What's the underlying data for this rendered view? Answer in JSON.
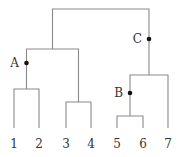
{
  "diagram": {
    "type": "dendrogram",
    "leaves": [
      {
        "id": "1",
        "label": "1",
        "x": 14
      },
      {
        "id": "2",
        "label": "2",
        "x": 39
      },
      {
        "id": "3",
        "label": "3",
        "x": 66
      },
      {
        "id": "4",
        "label": "4",
        "x": 91
      },
      {
        "id": "5",
        "label": "5",
        "x": 117
      },
      {
        "id": "6",
        "label": "6",
        "x": 143
      },
      {
        "id": "7",
        "label": "7",
        "x": 168
      }
    ],
    "leaf_bottom_y": 128,
    "label_y": 148,
    "merges": [
      {
        "id": "m12",
        "children": [
          "1",
          "2"
        ],
        "height_y": 89
      },
      {
        "id": "m34",
        "children": [
          "3",
          "4"
        ],
        "height_y": 102
      },
      {
        "id": "m56",
        "children": [
          "5",
          "6"
        ],
        "height_y": 116
      },
      {
        "id": "mA",
        "children": [
          "m12",
          "m34"
        ],
        "height_y": 49
      },
      {
        "id": "mB7",
        "children": [
          "m56",
          "7"
        ],
        "height_y": 75
      },
      {
        "id": "root",
        "children": [
          "mA",
          "mB7"
        ],
        "height_y": 9
      }
    ],
    "marked_nodes": [
      {
        "label": "A",
        "x": 26.5,
        "y": 63
      },
      {
        "label": "B",
        "x": 130,
        "y": 93
      },
      {
        "label": "C",
        "x": 149,
        "y": 39
      }
    ]
  }
}
